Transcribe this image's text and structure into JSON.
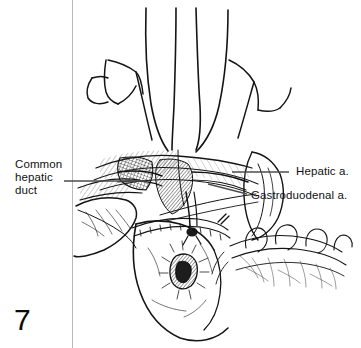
{
  "figure": {
    "number": "7",
    "background_color": "#ffffff",
    "ink_color": "#111111",
    "width": 361,
    "height": 348
  },
  "labels": {
    "common_hepatic_duct": "Common\nhepatic\nduct",
    "hepatic_artery": "Hepatic a.",
    "gastroduodenal_artery": "Gastroduodenal a."
  },
  "illustration": {
    "title": "surgical-anatomy-line-drawing",
    "description": "Pen-and-ink operative illustration of the upper abdomen showing retractor blades, liver lobe, duodenum and dissected hepatic vessels",
    "rule_color": "#9a9a9a"
  }
}
